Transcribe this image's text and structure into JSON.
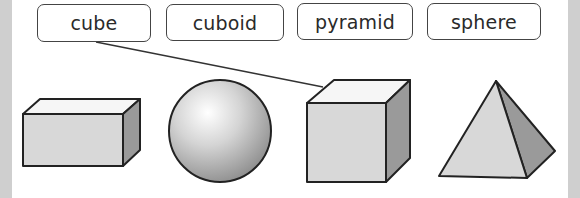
{
  "labels": [
    {
      "id": "cube",
      "text": "cube"
    },
    {
      "id": "cuboid",
      "text": "cuboid"
    },
    {
      "id": "pyramid",
      "text": "pyramid"
    },
    {
      "id": "sphere",
      "text": "sphere"
    }
  ],
  "shapes": [
    {
      "id": "cuboid",
      "name": "cuboid"
    },
    {
      "id": "sphere",
      "name": "sphere"
    },
    {
      "id": "cube",
      "name": "cube"
    },
    {
      "id": "pyramid",
      "name": "pyramid"
    }
  ],
  "connections": [
    {
      "from_label": "cube",
      "to_shape": "cube"
    }
  ],
  "colors": {
    "front_face": "#d8d8d8",
    "top_face": "#f6f6f6",
    "side_face": "#9a9a9a",
    "outline": "#222222",
    "band": "#cfcfcf"
  }
}
